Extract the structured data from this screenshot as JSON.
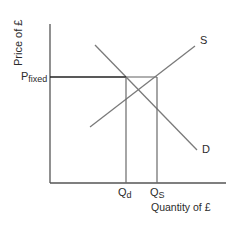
{
  "diagram": {
    "type": "supply-demand price floor",
    "y_axis_label": "Price of £",
    "x_axis_label": "Quantity of £",
    "price_label_main": "P",
    "price_label_sub": "fixed",
    "qd_label_main": "Q",
    "qd_label_sub": "d",
    "qs_label_main": "Q",
    "qs_label_sub": "S",
    "supply_label": "S",
    "demand_label": "D",
    "colors": {
      "axis": "#555555",
      "curve": "#7a7a7a",
      "price_line": "#222222",
      "text": "#2b2b2b"
    }
  }
}
